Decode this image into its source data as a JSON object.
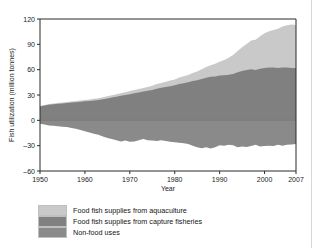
{
  "figure": {
    "name": "fish-utilization-stacked-area-chart"
  },
  "colors": {
    "aquaculture": "#c9c9c9",
    "capture_fisheries": "#808080",
    "non_food": "#8a8a8a",
    "axis": "#2b2b2b",
    "background": "#ffffff"
  },
  "legend": {
    "position": "below-plot",
    "items": [
      {
        "label": "Food fish supplies from aquaculture",
        "color": "#c9c9c9",
        "swatch_name": "legend-swatch-aquaculture"
      },
      {
        "label": "Food fish supplies from capture fisheries",
        "color": "#808080",
        "swatch_name": "legend-swatch-capture-fisheries"
      },
      {
        "label": "Non-food uses",
        "color": "#8a8a8a",
        "swatch_name": "legend-swatch-non-food-uses"
      }
    ]
  },
  "chart_data": {
    "type": "area",
    "title": "",
    "xlabel": "Year",
    "ylabel": "Fish utilization (million tonnes)",
    "xlim": [
      1950,
      2007
    ],
    "ylim": [
      -60,
      120
    ],
    "yticks": [
      -60,
      -30,
      0,
      30,
      60,
      90,
      120
    ],
    "ytick_labels": [
      "–60",
      "–30",
      "0",
      "30",
      "60",
      "90",
      "120"
    ],
    "xticks": [
      1950,
      1960,
      1970,
      1980,
      1990,
      2000,
      2007
    ],
    "xtick_labels": [
      "1950",
      "1960",
      "1970",
      "1980",
      "1990",
      "2000",
      "2007"
    ],
    "grid": false,
    "stacked": true,
    "note": "Positive axis stacks capture fisheries then aquaculture; non-food uses plotted as negative values below zero.",
    "x": [
      1950,
      1951,
      1952,
      1953,
      1954,
      1955,
      1956,
      1957,
      1958,
      1959,
      1960,
      1961,
      1962,
      1963,
      1964,
      1965,
      1966,
      1967,
      1968,
      1969,
      1970,
      1971,
      1972,
      1973,
      1974,
      1975,
      1976,
      1977,
      1978,
      1979,
      1980,
      1981,
      1982,
      1983,
      1984,
      1985,
      1986,
      1987,
      1988,
      1989,
      1990,
      1991,
      1992,
      1993,
      1994,
      1995,
      1996,
      1997,
      1998,
      1999,
      2000,
      2001,
      2002,
      2003,
      2004,
      2005,
      2006,
      2007
    ],
    "series": [
      {
        "name": "Food fish supplies from capture fisheries",
        "color": "#808080",
        "values": [
          16.5,
          17.5,
          18.5,
          19.0,
          19.5,
          20.0,
          20.5,
          21.0,
          21.5,
          22.0,
          22.5,
          23.0,
          23.5,
          24.0,
          25.0,
          26.0,
          27.0,
          28.0,
          29.0,
          30.0,
          31.0,
          32.0,
          33.0,
          34.0,
          35.0,
          36.0,
          37.5,
          38.5,
          39.5,
          40.5,
          41.5,
          43.0,
          44.0,
          45.0,
          46.5,
          47.5,
          49.0,
          50.5,
          51.5,
          52.0,
          53.0,
          53.5,
          54.0,
          55.0,
          57.0,
          58.5,
          59.5,
          60.5,
          59.5,
          61.0,
          62.0,
          62.5,
          62.5,
          62.0,
          62.5,
          62.5,
          62.0,
          62.0
        ]
      },
      {
        "name": "Food fish supplies from aquaculture",
        "color": "#c9c9c9",
        "values": [
          0.5,
          0.6,
          0.7,
          0.8,
          0.9,
          1.0,
          1.1,
          1.2,
          1.3,
          1.4,
          1.6,
          1.8,
          2.0,
          2.2,
          2.4,
          2.6,
          2.8,
          3.0,
          3.2,
          3.4,
          3.6,
          3.8,
          4.0,
          4.3,
          4.6,
          5.0,
          5.4,
          5.8,
          6.2,
          6.6,
          7.0,
          7.6,
          8.2,
          8.8,
          9.6,
          10.4,
          11.4,
          12.6,
          13.8,
          15.0,
          16.5,
          18.0,
          20.0,
          22.5,
          25.0,
          28.0,
          31.0,
          34.0,
          36.0,
          38.5,
          41.0,
          43.0,
          44.5,
          46.5,
          48.5,
          50.0,
          51.5,
          51.0
        ]
      },
      {
        "name": "Non-food uses",
        "color": "#8a8a8a",
        "values": [
          -4.0,
          -5.0,
          -6.0,
          -6.5,
          -7.0,
          -7.5,
          -8.0,
          -9.0,
          -10.0,
          -11.5,
          -13.0,
          -14.5,
          -16.0,
          -17.0,
          -19.0,
          -21.0,
          -22.0,
          -23.5,
          -25.0,
          -24.0,
          -25.5,
          -25.0,
          -23.5,
          -22.0,
          -23.5,
          -24.0,
          -24.5,
          -23.5,
          -24.5,
          -25.5,
          -26.0,
          -26.5,
          -27.0,
          -28.0,
          -30.0,
          -32.0,
          -33.0,
          -32.0,
          -33.5,
          -32.0,
          -29.5,
          -30.0,
          -29.0,
          -29.5,
          -32.0,
          -31.0,
          -31.5,
          -30.5,
          -29.0,
          -31.0,
          -30.5,
          -30.0,
          -30.5,
          -29.0,
          -30.0,
          -29.0,
          -28.5,
          -28.0
        ]
      }
    ]
  }
}
